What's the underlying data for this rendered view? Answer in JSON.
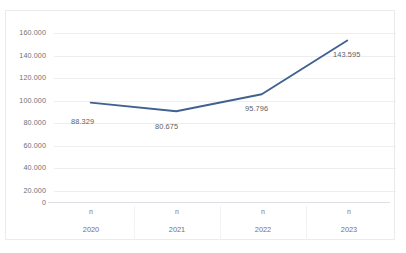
{
  "chart_data": {
    "type": "line",
    "title": "",
    "xlabel": "",
    "ylabel": "",
    "categories": [
      "2020",
      "2021",
      "2022",
      "2023"
    ],
    "category_sublabels": [
      "n",
      "n",
      "n",
      "n"
    ],
    "values": [
      88329,
      80675,
      95796,
      143595
    ],
    "data_labels": [
      "88.329",
      "80.675",
      "95.796",
      "143.595"
    ],
    "ylim": [
      0,
      160000
    ],
    "ytick_values": [
      0,
      20000,
      40000,
      60000,
      80000,
      100000,
      120000,
      140000,
      160000
    ],
    "ytick_labels": [
      "0",
      "20.000",
      "40.000",
      "60.000",
      "80.000",
      "100.000",
      "120.000",
      "140.000",
      "160.000"
    ],
    "grid": true,
    "legend": false,
    "legend_position": "none",
    "series": [
      {
        "name": "n",
        "values": [
          88329,
          80675,
          95796,
          143595
        ],
        "color": "#41618F",
        "markers": false,
        "line_width": 1.9
      }
    ]
  },
  "colors": {
    "series_line": "#41618F",
    "gridline": "#eceef0",
    "axis_line": "#dcdfe3",
    "border": "#e9eaec",
    "tick_text": "#6f6f73",
    "data_label_text": "#5e5e62",
    "background": "#ffffff"
  }
}
